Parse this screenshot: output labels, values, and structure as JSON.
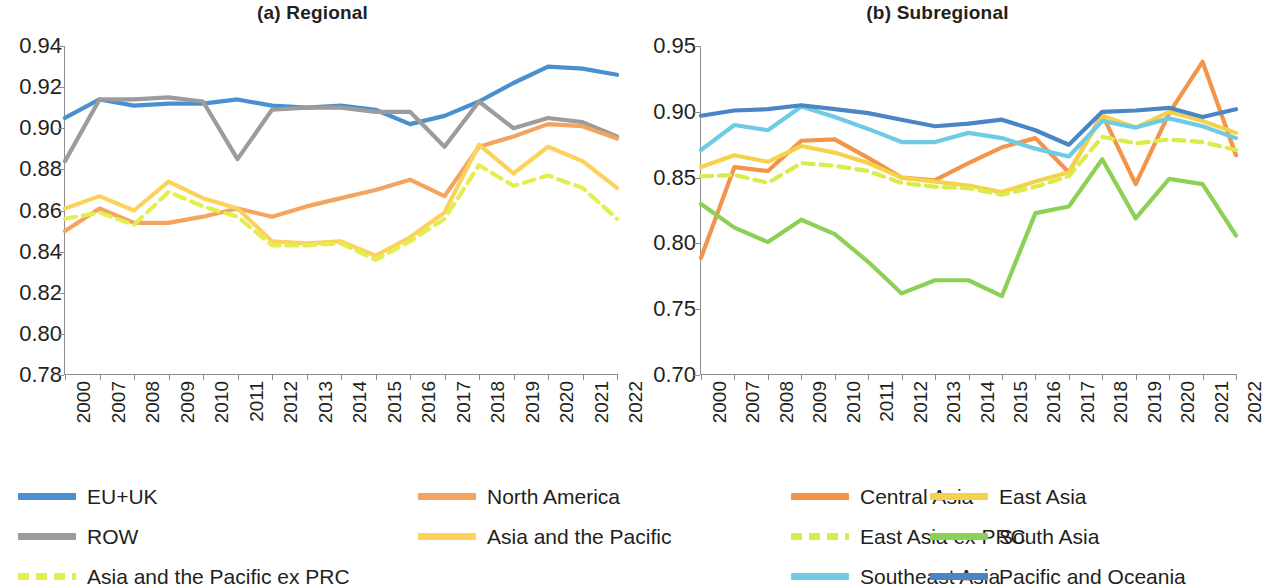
{
  "figure": {
    "panels": [
      {
        "id": "regional",
        "title": "(a) Regional"
      },
      {
        "id": "subregional",
        "title": "(b) Subregional"
      }
    ]
  },
  "colors": {
    "eu_uk": "#4A90CE",
    "row": "#9C9C9C",
    "north_america": "#F4A460",
    "asia_pacific": "#FBD25B",
    "asia_pacific_ex_prc": "#E2EF4D",
    "central_asia": "#F2944A",
    "east_asia": "#F6D24C",
    "east_asia_ex_prc": "#DCEB4C",
    "south_asia": "#8CD055",
    "southeast_asia": "#6FCBE3",
    "pacific_oceania": "#4A86C5",
    "axis": "#8D8D8D",
    "text": "#231F20"
  },
  "chart_data": [
    {
      "type": "line",
      "title": "(a) Regional",
      "xlabel": "",
      "ylabel": "",
      "grid": false,
      "legend_position": "bottom",
      "categories": [
        "2000",
        "2007",
        "2008",
        "2009",
        "2010",
        "2011",
        "2012",
        "2013",
        "2014",
        "2015",
        "2016",
        "2017",
        "2018",
        "2019",
        "2020",
        "2021",
        "2022"
      ],
      "ylim": [
        0.78,
        0.94
      ],
      "yticks": [
        "0.94",
        "0.92",
        "0.90",
        "0.88",
        "0.86",
        "0.84",
        "0.82",
        "0.80",
        "0.78"
      ],
      "series": [
        {
          "name": "EU+UK",
          "color": "#4A90CE",
          "style": "solid",
          "values": [
            0.905,
            0.914,
            0.911,
            0.912,
            0.912,
            0.914,
            0.911,
            0.91,
            0.911,
            0.909,
            0.902,
            0.906,
            0.913,
            0.922,
            0.93,
            0.929,
            0.926
          ]
        },
        {
          "name": "ROW",
          "color": "#9C9C9C",
          "style": "solid",
          "values": [
            0.884,
            0.914,
            0.914,
            0.915,
            0.913,
            0.885,
            0.909,
            0.91,
            0.91,
            0.908,
            0.908,
            0.891,
            0.913,
            0.9,
            0.905,
            0.903,
            0.896
          ]
        },
        {
          "name": "North America",
          "color": "#F4A460",
          "style": "solid",
          "values": [
            0.85,
            0.861,
            0.854,
            0.854,
            0.857,
            0.861,
            0.857,
            0.862,
            0.866,
            0.87,
            0.875,
            0.867,
            0.891,
            0.896,
            0.902,
            0.901,
            0.895
          ]
        },
        {
          "name": "Asia and the Pacific",
          "color": "#FBD25B",
          "style": "solid",
          "values": [
            0.861,
            0.867,
            0.86,
            0.874,
            0.866,
            0.861,
            0.845,
            0.844,
            0.845,
            0.838,
            0.847,
            0.859,
            0.892,
            0.878,
            0.891,
            0.884,
            0.871
          ]
        },
        {
          "name": "Asia and the Pacific ex PRC",
          "color": "#E2EF4D",
          "style": "dashed",
          "values": [
            0.856,
            0.859,
            0.853,
            0.869,
            0.862,
            0.857,
            0.843,
            0.843,
            0.844,
            0.836,
            0.845,
            0.856,
            0.882,
            0.872,
            0.877,
            0.871,
            0.856
          ]
        }
      ]
    },
    {
      "type": "line",
      "title": "(b) Subregional",
      "xlabel": "",
      "ylabel": "",
      "grid": false,
      "legend_position": "bottom",
      "categories": [
        "2000",
        "2007",
        "2008",
        "2009",
        "2010",
        "2011",
        "2012",
        "2013",
        "2014",
        "2015",
        "2016",
        "2017",
        "2018",
        "2019",
        "2020",
        "2021",
        "2022"
      ],
      "ylim": [
        0.7,
        0.95
      ],
      "yticks": [
        "0.95",
        "0.90",
        "0.85",
        "0.80",
        "0.75",
        "0.70"
      ],
      "series": [
        {
          "name": "Central Asia",
          "color": "#F2944A",
          "style": "solid",
          "values": [
            0.789,
            0.858,
            0.855,
            0.878,
            0.879,
            0.865,
            0.85,
            0.848,
            0.861,
            0.873,
            0.88,
            0.854,
            0.898,
            0.845,
            0.899,
            0.938,
            0.867
          ]
        },
        {
          "name": "East Asia",
          "color": "#F6D24C",
          "style": "solid",
          "values": [
            0.858,
            0.867,
            0.862,
            0.874,
            0.869,
            0.861,
            0.85,
            0.847,
            0.844,
            0.839,
            0.847,
            0.854,
            0.897,
            0.888,
            0.9,
            0.893,
            0.884
          ]
        },
        {
          "name": "East Asia ex PRC",
          "color": "#DCEB4C",
          "style": "dashed",
          "values": [
            0.851,
            0.852,
            0.846,
            0.861,
            0.859,
            0.855,
            0.846,
            0.843,
            0.842,
            0.837,
            0.843,
            0.851,
            0.881,
            0.876,
            0.879,
            0.877,
            0.871
          ]
        },
        {
          "name": "South Asia",
          "color": "#8CD055",
          "style": "solid",
          "values": [
            0.83,
            0.812,
            0.801,
            0.818,
            0.807,
            0.786,
            0.762,
            0.772,
            0.772,
            0.76,
            0.823,
            0.828,
            0.864,
            0.819,
            0.849,
            0.845,
            0.806
          ]
        },
        {
          "name": "Southeast Asia",
          "color": "#6FCBE3",
          "style": "solid",
          "values": [
            0.871,
            0.89,
            0.886,
            0.904,
            0.896,
            0.887,
            0.877,
            0.877,
            0.884,
            0.88,
            0.872,
            0.866,
            0.893,
            0.888,
            0.895,
            0.889,
            0.88
          ]
        },
        {
          "name": "Pacific and Oceania",
          "color": "#4A86C5",
          "style": "solid",
          "values": [
            0.897,
            0.901,
            0.902,
            0.905,
            0.902,
            0.899,
            0.894,
            0.889,
            0.891,
            0.894,
            0.886,
            0.875,
            0.9,
            0.901,
            0.903,
            0.896,
            0.902
          ]
        }
      ]
    }
  ],
  "legends": {
    "left": [
      {
        "label": "EU+UK",
        "color": "#4A90CE",
        "style": "solid",
        "col": 0,
        "row": 0
      },
      {
        "label": "North America",
        "color": "#F4A460",
        "style": "solid",
        "col": 1,
        "row": 0
      },
      {
        "label": "ROW",
        "color": "#9C9C9C",
        "style": "solid",
        "col": 0,
        "row": 1
      },
      {
        "label": "Asia and the Pacific",
        "color": "#FBD25B",
        "style": "solid",
        "col": 1,
        "row": 1
      },
      {
        "label": "Asia and the Pacific ex PRC",
        "color": "#E2EF4D",
        "style": "dashed",
        "col": 0,
        "row": 2
      }
    ],
    "right": [
      {
        "label": "Central Asia",
        "color": "#F2944A",
        "style": "solid",
        "col": 0,
        "row": 0
      },
      {
        "label": "East Asia",
        "color": "#F6D24C",
        "style": "solid",
        "col": 1,
        "row": 0
      },
      {
        "label": "East Asia ex PRC",
        "color": "#DCEB4C",
        "style": "dashed",
        "col": 0,
        "row": 1
      },
      {
        "label": "South Asia",
        "color": "#8CD055",
        "style": "solid",
        "col": 1,
        "row": 1
      },
      {
        "label": "Southeast Asia",
        "color": "#6FCBE3",
        "style": "solid",
        "col": 0,
        "row": 2
      },
      {
        "label": "Pacific and Oceania",
        "color": "#4A86C5",
        "style": "solid",
        "col": 1,
        "row": 2
      }
    ]
  }
}
